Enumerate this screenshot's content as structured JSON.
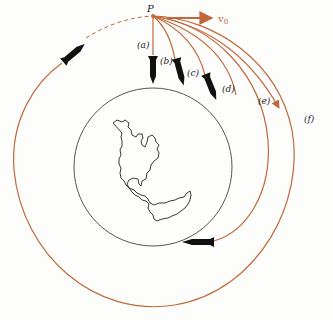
{
  "diagram": {
    "point_label": "P",
    "velocity_label": "v",
    "velocity_subscript": "0",
    "trajectory_labels": [
      "(a)",
      "(b)",
      "(c)",
      "(d)",
      "(e)",
      "(f)"
    ],
    "colors": {
      "trajectory": "#c0683a",
      "earth_outline": "#555555",
      "continent": "#222222",
      "rocket": "#111111",
      "label": "#222222"
    },
    "elements": {
      "earth": "circle with continent outline (Americas)",
      "orbit": "full circular orbit, dashed near completion",
      "escape": "trajectory (f) with arrowhead leaving the figure"
    }
  }
}
